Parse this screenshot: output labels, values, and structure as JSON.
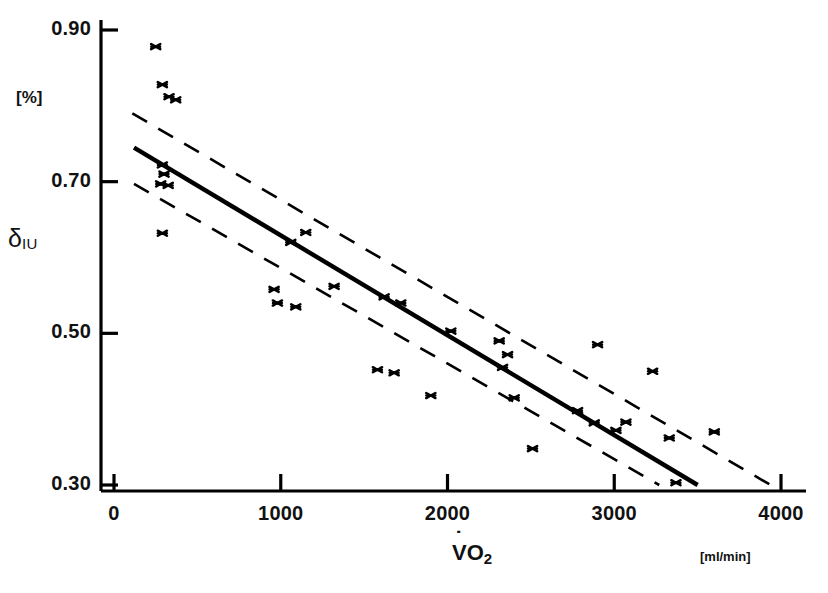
{
  "figure": {
    "y_axis_title": "δ",
    "y_axis_title_sub": "IU",
    "y_unit_label": "[%]",
    "x_axis_title": "VO",
    "x_axis_title_sub": "2",
    "x_unit_label": "[ml/min]"
  },
  "chart_data": {
    "type": "scatter",
    "title": "",
    "xlabel": "VO2",
    "ylabel": "δIU",
    "x_unit": "ml/min",
    "y_unit": "%",
    "xlim": [
      0,
      4000
    ],
    "ylim": [
      0.3,
      0.9
    ],
    "grid": false,
    "legend": false,
    "xticks": [
      0,
      1000,
      2000,
      3000,
      4000
    ],
    "xtick_labels": [
      "0",
      "1000",
      "2000",
      "3000",
      "4000"
    ],
    "yticks": [
      0.3,
      0.5,
      0.7,
      0.9
    ],
    "ytick_labels": [
      "0.30",
      "0.50",
      "0.70",
      "0.90"
    ],
    "points": [
      {
        "x": 250,
        "y": 0.878
      },
      {
        "x": 290,
        "y": 0.828
      },
      {
        "x": 330,
        "y": 0.812
      },
      {
        "x": 370,
        "y": 0.808
      },
      {
        "x": 290,
        "y": 0.722
      },
      {
        "x": 300,
        "y": 0.71
      },
      {
        "x": 280,
        "y": 0.697
      },
      {
        "x": 325,
        "y": 0.695
      },
      {
        "x": 290,
        "y": 0.632
      },
      {
        "x": 960,
        "y": 0.558
      },
      {
        "x": 980,
        "y": 0.54
      },
      {
        "x": 1060,
        "y": 0.62
      },
      {
        "x": 1150,
        "y": 0.633
      },
      {
        "x": 1090,
        "y": 0.535
      },
      {
        "x": 1320,
        "y": 0.562
      },
      {
        "x": 1580,
        "y": 0.452
      },
      {
        "x": 1680,
        "y": 0.448
      },
      {
        "x": 1620,
        "y": 0.548
      },
      {
        "x": 1720,
        "y": 0.54
      },
      {
        "x": 1900,
        "y": 0.418
      },
      {
        "x": 2020,
        "y": 0.503
      },
      {
        "x": 2310,
        "y": 0.49
      },
      {
        "x": 2360,
        "y": 0.472
      },
      {
        "x": 2330,
        "y": 0.455
      },
      {
        "x": 2400,
        "y": 0.415
      },
      {
        "x": 2510,
        "y": 0.348
      },
      {
        "x": 2780,
        "y": 0.398
      },
      {
        "x": 2900,
        "y": 0.485
      },
      {
        "x": 2880,
        "y": 0.382
      },
      {
        "x": 3010,
        "y": 0.372
      },
      {
        "x": 3070,
        "y": 0.383
      },
      {
        "x": 3230,
        "y": 0.45
      },
      {
        "x": 3330,
        "y": 0.362
      },
      {
        "x": 3370,
        "y": 0.303
      },
      {
        "x": 3600,
        "y": 0.37
      }
    ],
    "regression_line": {
      "style": "solid",
      "x_start": 120,
      "y_start": 0.745,
      "x_end": 3500,
      "y_end": 0.3
    },
    "confidence_bands": [
      {
        "name": "upper",
        "style": "dashed",
        "x_start": 110,
        "y_start": 0.79,
        "x_end": 4000,
        "y_end": 0.292
      },
      {
        "name": "lower",
        "style": "dashed",
        "x_start": 120,
        "y_start": 0.697,
        "x_end": 3270,
        "y_end": 0.3
      }
    ]
  }
}
